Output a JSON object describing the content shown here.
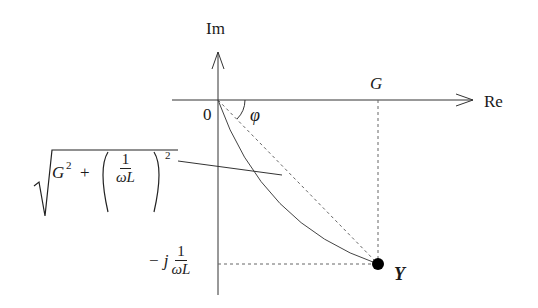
{
  "diagram": {
    "type": "complex-plane phasor diagram (admittance)",
    "colors": {
      "line": "#333333",
      "dashed": "#666666",
      "point": "#000000",
      "background": "#ffffff"
    },
    "axes": {
      "real_label": "Re",
      "imag_label": "Im",
      "origin_label": "0"
    },
    "labels": {
      "angle": "φ",
      "real_part": "G",
      "point": "Y",
      "imag_prefix": "− j",
      "imag_num": "1",
      "imag_den": "ωL",
      "magnitude_sqrt": "√",
      "magnitude_G": "G",
      "magnitude_G_exp": "2",
      "magnitude_plus": "+",
      "magnitude_num": "1",
      "magnitude_den": "ωL",
      "magnitude_exp": "2"
    }
  }
}
